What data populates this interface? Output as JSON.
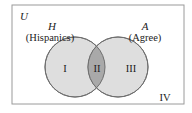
{
  "universe": {
    "label": "U"
  },
  "sets": [
    {
      "symbol": "H",
      "name": "(Hispanics)"
    },
    {
      "symbol": "A",
      "name": "(Agree)"
    }
  ],
  "regions": [
    {
      "label": "I"
    },
    {
      "label": "II"
    },
    {
      "label": "III"
    },
    {
      "label": "IV"
    }
  ],
  "colors": {
    "border": "#9a9a9a",
    "circle_fill": "#dedede",
    "circle_stroke": "#6e6e6e",
    "intersection_fill": "#a9a9a9"
  }
}
